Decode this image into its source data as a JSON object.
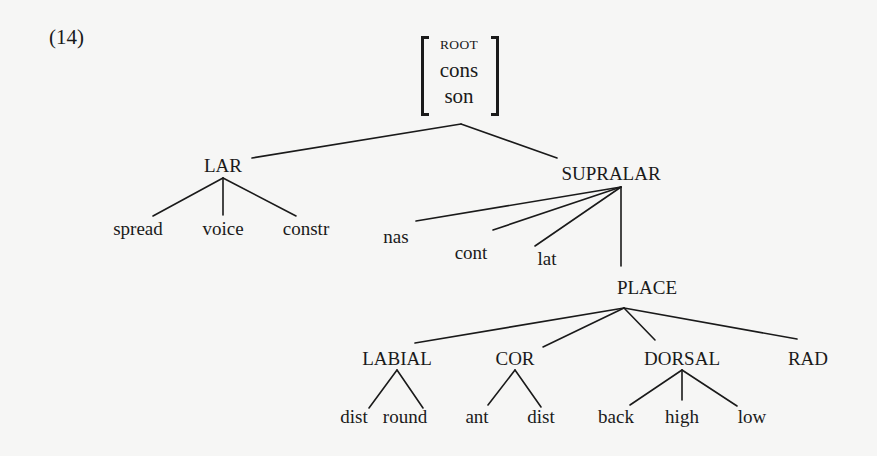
{
  "example_number": "(14)",
  "root": {
    "features": [
      "ROOT",
      "cons",
      "son"
    ]
  },
  "colors": {
    "line": "#1a1a1a",
    "text": "#1a1a1a",
    "background": "#f6f6f5"
  },
  "nodes": {
    "lar": {
      "label": "LAR",
      "x": 223,
      "y": 175
    },
    "supralar": {
      "label": "SUPRALAR",
      "x": 611,
      "y": 183
    },
    "spread": {
      "label": "spread",
      "x": 138,
      "y": 238
    },
    "voice": {
      "label": "voice",
      "x": 223,
      "y": 238
    },
    "constr": {
      "label": "constr",
      "x": 306,
      "y": 238
    },
    "nas": {
      "label": "nas",
      "x": 396,
      "y": 246
    },
    "cont": {
      "label": "cont",
      "x": 471,
      "y": 262
    },
    "lat": {
      "label": "lat",
      "x": 547,
      "y": 268
    },
    "place": {
      "label": "PLACE",
      "x": 647,
      "y": 297
    },
    "labial": {
      "label": "LABIAL",
      "x": 397,
      "y": 368
    },
    "cor": {
      "label": "COR",
      "x": 515,
      "y": 368
    },
    "dorsal": {
      "label": "DORSAL",
      "x": 682,
      "y": 368
    },
    "rad": {
      "label": "RAD",
      "x": 808,
      "y": 368
    },
    "dist1": {
      "label": "dist",
      "x": 354,
      "y": 426
    },
    "round": {
      "label": "round",
      "x": 405,
      "y": 426
    },
    "ant": {
      "label": "ant",
      "x": 477,
      "y": 426
    },
    "dist2": {
      "label": "dist",
      "x": 541,
      "y": 426
    },
    "back": {
      "label": "back",
      "x": 616,
      "y": 426
    },
    "high": {
      "label": "high",
      "x": 682,
      "y": 426
    },
    "low": {
      "label": "low",
      "x": 752,
      "y": 426
    }
  },
  "edges": [
    {
      "from": "root",
      "to": "lar",
      "x1": 461,
      "y1": 124,
      "x2": 252,
      "y2": 158
    },
    {
      "from": "root",
      "to": "supralar",
      "x1": 461,
      "y1": 124,
      "x2": 557,
      "y2": 158
    },
    {
      "from": "lar",
      "to": "spread",
      "x1": 223,
      "y1": 178,
      "x2": 153,
      "y2": 216
    },
    {
      "from": "lar",
      "to": "voice",
      "x1": 223,
      "y1": 178,
      "x2": 223,
      "y2": 215
    },
    {
      "from": "lar",
      "to": "constr",
      "x1": 223,
      "y1": 178,
      "x2": 296,
      "y2": 216
    },
    {
      "from": "supralar",
      "to": "nas",
      "x1": 621,
      "y1": 187,
      "x2": 416,
      "y2": 221
    },
    {
      "from": "supralar",
      "to": "cont",
      "x1": 621,
      "y1": 187,
      "x2": 493,
      "y2": 230
    },
    {
      "from": "supralar",
      "to": "lat",
      "x1": 621,
      "y1": 187,
      "x2": 535,
      "y2": 246
    },
    {
      "from": "supralar",
      "to": "place",
      "x1": 621,
      "y1": 187,
      "x2": 621,
      "y2": 266
    },
    {
      "from": "place",
      "to": "labial",
      "x1": 624,
      "y1": 308,
      "x2": 415,
      "y2": 343
    },
    {
      "from": "place",
      "to": "cor",
      "x1": 624,
      "y1": 308,
      "x2": 543,
      "y2": 347
    },
    {
      "from": "place",
      "to": "dorsal",
      "x1": 624,
      "y1": 308,
      "x2": 655,
      "y2": 340
    },
    {
      "from": "place",
      "to": "rad",
      "x1": 624,
      "y1": 308,
      "x2": 797,
      "y2": 339
    },
    {
      "from": "labial",
      "to": "dist1",
      "x1": 397,
      "y1": 370,
      "x2": 369,
      "y2": 408
    },
    {
      "from": "labial",
      "to": "round",
      "x1": 397,
      "y1": 370,
      "x2": 423,
      "y2": 408
    },
    {
      "from": "cor",
      "to": "ant",
      "x1": 515,
      "y1": 370,
      "x2": 488,
      "y2": 405
    },
    {
      "from": "cor",
      "to": "dist2",
      "x1": 515,
      "y1": 370,
      "x2": 541,
      "y2": 407
    },
    {
      "from": "dorsal",
      "to": "back",
      "x1": 682,
      "y1": 370,
      "x2": 630,
      "y2": 405
    },
    {
      "from": "dorsal",
      "to": "high",
      "x1": 682,
      "y1": 370,
      "x2": 682,
      "y2": 400
    },
    {
      "from": "dorsal",
      "to": "low",
      "x1": 682,
      "y1": 370,
      "x2": 737,
      "y2": 406
    }
  ]
}
